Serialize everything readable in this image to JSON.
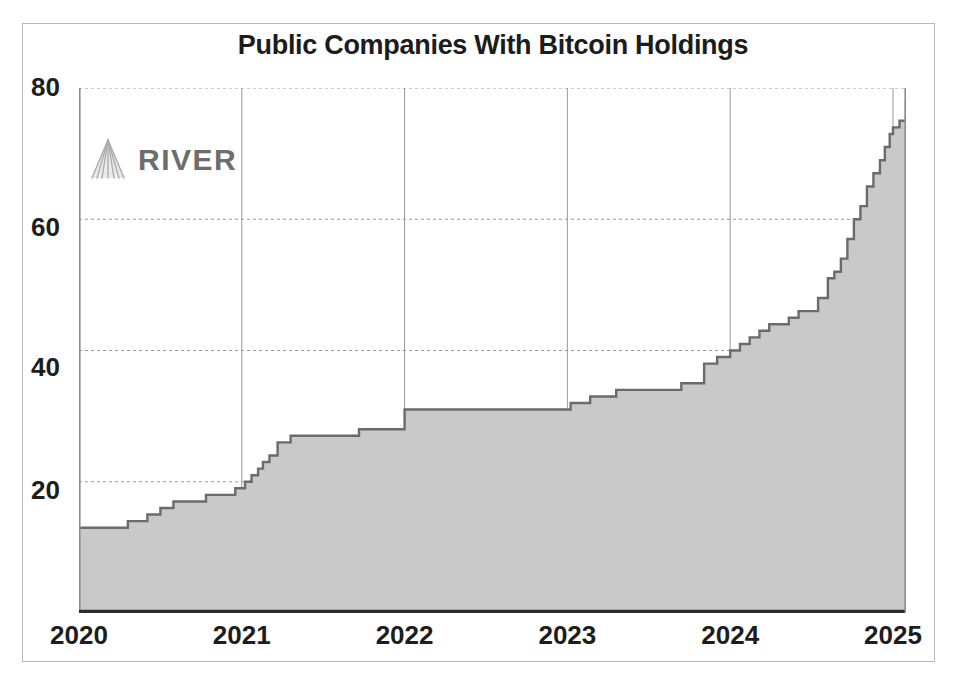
{
  "chart_data": {
    "type": "area",
    "title": "Public Companies With Bitcoin Holdings",
    "xlabel": "",
    "ylabel": "",
    "xlim": [
      2020.0,
      2025.08
    ],
    "ylim": [
      0,
      80
    ],
    "xticks": [
      "2020",
      "2021",
      "2022",
      "2023",
      "2024",
      "2025"
    ],
    "xtick_values": [
      2020,
      2021,
      2022,
      2023,
      2024,
      2025
    ],
    "yticks": [
      "20",
      "40",
      "60",
      "80"
    ],
    "ytick_values": [
      20,
      40,
      60,
      80
    ],
    "grid": true,
    "grid_style": "dashed",
    "legend": "none",
    "step_shape": "post",
    "colors": {
      "area_fill": "#c9c9c9",
      "line": "#6b6b6b",
      "axis": "#2c2c2c",
      "grid": "#9a9a9a",
      "title_text": "#1c1c1c",
      "tick_text": "#1d1d1d",
      "frame": "#b9b9b9",
      "background": "#ffffff",
      "watermark": "#6d6d6d"
    },
    "series": [
      {
        "name": "Public companies with bitcoin holdings",
        "x": [
          2020.0,
          2020.18,
          2020.3,
          2020.42,
          2020.5,
          2020.58,
          2020.66,
          2020.78,
          2020.88,
          2020.96,
          2021.02,
          2021.06,
          2021.1,
          2021.13,
          2021.17,
          2021.22,
          2021.3,
          2021.5,
          2021.72,
          2021.86,
          2022.0,
          2022.96,
          2023.02,
          2023.14,
          2023.3,
          2023.55,
          2023.7,
          2023.84,
          2023.92,
          2024.0,
          2024.06,
          2024.12,
          2024.18,
          2024.24,
          2024.3,
          2024.36,
          2024.42,
          2024.48,
          2024.54,
          2024.6,
          2024.64,
          2024.68,
          2024.72,
          2024.76,
          2024.8,
          2024.84,
          2024.88,
          2024.92,
          2024.95,
          2024.98,
          2025.0,
          2025.04,
          2025.08
        ],
        "y": [
          13,
          13,
          14,
          15,
          16,
          17,
          17,
          18,
          18,
          19,
          20,
          21,
          22,
          23,
          24,
          26,
          27,
          27,
          28,
          28,
          31,
          31,
          32,
          33,
          34,
          34,
          35,
          38,
          39,
          40,
          41,
          42,
          43,
          44,
          44,
          45,
          46,
          46,
          48,
          51,
          52,
          54,
          57,
          60,
          62,
          65,
          67,
          69,
          71,
          73,
          74,
          75,
          78
        ]
      }
    ],
    "notes": {
      "start_value": 13,
      "end_value": 78,
      "plateau_2022": 31
    }
  },
  "watermark": {
    "brand": "RIVER",
    "mark_name": "river-fan-logo"
  }
}
